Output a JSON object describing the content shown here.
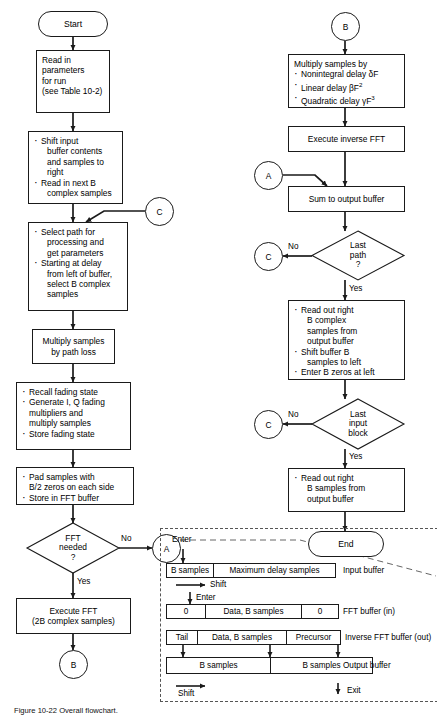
{
  "figure": {
    "caption": "Figure 10-22  Overall flowchart.",
    "title": "Overall flowchart"
  },
  "left_column": {
    "start": "Start",
    "read_params": {
      "l1": "Read in",
      "l2": "parameters",
      "l3": "for run",
      "l4": "(see Table 10-2)"
    },
    "shift_input": {
      "b1a": "Shift input",
      "b1b": "buffer contents",
      "b1c": "and samples to",
      "b1d": "right",
      "b2a": "Read in next B",
      "b2b": "complex samples"
    },
    "select_path": {
      "b1a": "Select path for",
      "b1b": "processing and",
      "b1c": "get parameters",
      "b2a": "Starting at delay",
      "b2b": "from left of buffer,",
      "b2c": "select B complex",
      "b2d": "samples"
    },
    "multiply_path_loss": {
      "l1": "Multiply samples",
      "l2": "by path loss"
    },
    "fading": {
      "b1": "Recall fading state",
      "b2a": "Generate I, Q fading",
      "b2b": "multipliers and",
      "b2c": "multiply samples",
      "b3": "Store fading state"
    },
    "pad": {
      "b1a": "Pad samples with",
      "b1b": "B/2 zeros on each side",
      "b2": "Store in FFT buffer"
    },
    "fft_decision": {
      "l1": "FFT",
      "l2": "needed",
      "l3": "?",
      "no": "No",
      "yes": "Yes"
    },
    "execute_fft": {
      "l1": "Execute FFT",
      "l2": "(2B complex samples)"
    },
    "connector_c_top": "C",
    "connector_a_out": "A",
    "connector_b_out": "B"
  },
  "right_column": {
    "connector_b_in": "B",
    "connector_a_in": "A",
    "multiply_samples": {
      "head": "Multiply samples by",
      "b1": "Nonintegral delay δF",
      "b2_pre": "Linear delay βF",
      "b2_sup": "2",
      "b3_pre": "Quadratic delay γF",
      "b3_sup": "3"
    },
    "inverse_fft": "Execute inverse FFT",
    "sum_output": "Sum to output buffer",
    "last_path": {
      "l1": "Last",
      "l2": "path",
      "l3": "?",
      "no": "No",
      "yes": "Yes",
      "connector": "C"
    },
    "read_out_complex": {
      "b1a": "Read out right",
      "b1b": "B complex",
      "b1c": "samples from",
      "b1d": "output buffer",
      "b2a": "Shift buffer B",
      "b2b": "samples to left",
      "b3": "Enter B zeros at left"
    },
    "last_input_block": {
      "l1": "Last",
      "l2": "input",
      "l3": "block",
      "no": "No",
      "yes": "Yes",
      "connector": "C"
    },
    "read_out_b": {
      "b1a": "Read out right",
      "b1b": "B samples from",
      "b1c": "output buffer"
    },
    "end": "End"
  },
  "buffer_panel": {
    "enter_top": "Enter",
    "enter_mid": "Enter",
    "shift_top": "Shift",
    "shift_bottom": "Shift",
    "exit": "Exit",
    "input_buffer": {
      "cells": [
        "B samples",
        "Maximum delay samples"
      ],
      "label": "Input buffer"
    },
    "fft_buffer_in": {
      "cells": [
        "0",
        "Data, B samples",
        "0"
      ],
      "label": "FFT buffer (in)"
    },
    "inverse_fft_buffer_out": {
      "cells": [
        "Tail",
        "Data, B samples",
        "Precursor"
      ],
      "label": "Inverse FFT buffer (out)"
    },
    "output_buffer": {
      "cells": [
        "B samples",
        "B samples"
      ],
      "label": "Output buffer"
    }
  },
  "style": {
    "line_color": "#1a1a1a",
    "dash_color": "#555555",
    "background": "#ffffff"
  }
}
